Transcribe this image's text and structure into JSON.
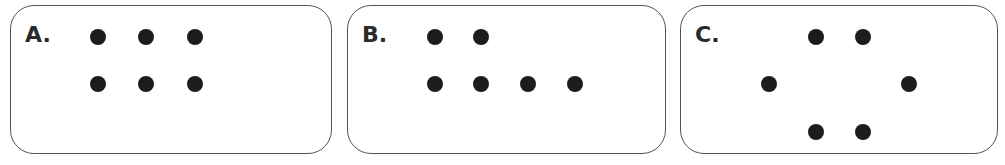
{
  "panels": [
    {
      "label": "A.",
      "left": 10,
      "width": 322,
      "dots": [
        [
          97,
          36
        ],
        [
          145,
          36
        ],
        [
          194,
          36
        ],
        [
          97,
          83
        ],
        [
          145,
          83
        ],
        [
          194,
          83
        ]
      ]
    },
    {
      "label": "B.",
      "left": 347,
      "width": 319,
      "dots": [
        [
          434,
          36
        ],
        [
          480,
          36
        ],
        [
          434,
          83
        ],
        [
          480,
          83
        ],
        [
          527,
          83
        ],
        [
          574,
          83
        ]
      ]
    },
    {
      "label": "C.",
      "left": 680,
      "width": 318,
      "dots": [
        [
          815,
          36
        ],
        [
          862,
          36
        ],
        [
          768,
          83
        ],
        [
          908,
          83
        ],
        [
          815,
          131
        ],
        [
          862,
          131
        ]
      ]
    }
  ],
  "colors": {
    "dot": "#1c1c1c",
    "border": "#555555",
    "label": "#2a2a2a"
  }
}
